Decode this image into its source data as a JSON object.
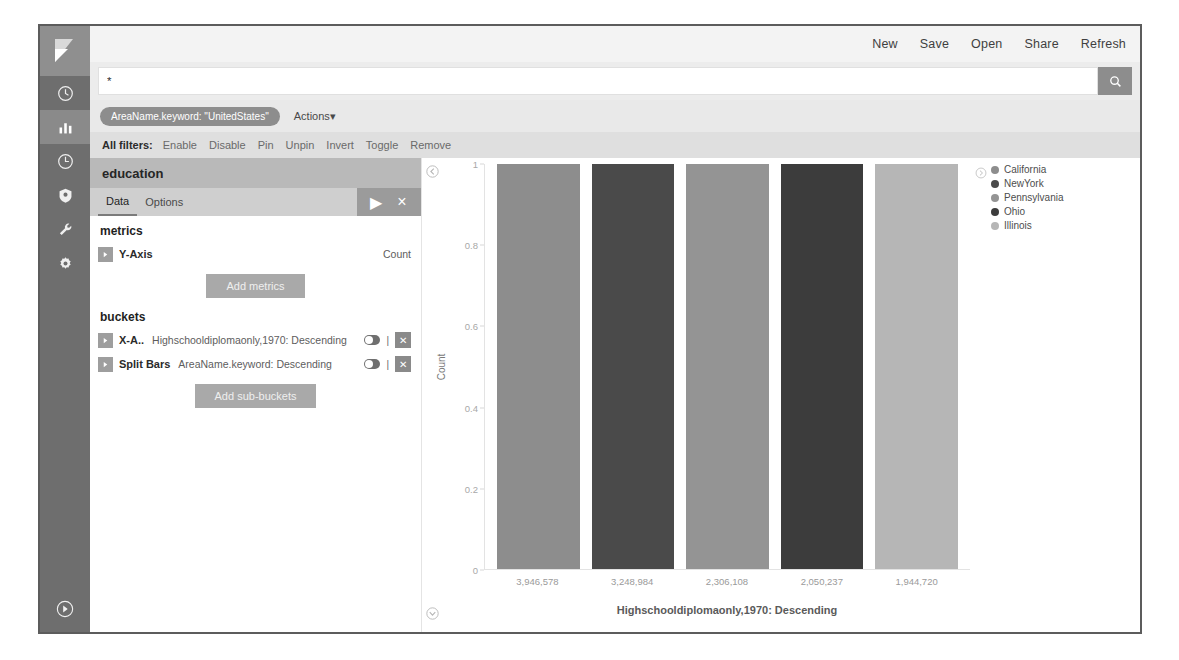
{
  "topnav": {
    "items": [
      {
        "label": "New",
        "name": "topnav-new"
      },
      {
        "label": "Save",
        "name": "topnav-save"
      },
      {
        "label": "Open",
        "name": "topnav-open"
      },
      {
        "label": "Share",
        "name": "topnav-share"
      },
      {
        "label": "Refresh",
        "name": "topnav-refresh"
      }
    ]
  },
  "search": {
    "value": "*",
    "placeholder": "Search...",
    "button_icon": "search-icon"
  },
  "filters": {
    "pill": "AreaName.keyword: \"UnitedStates\"",
    "actions_label": "Actions",
    "actions_caret": "▾",
    "all_filters_label": "All filters:",
    "links": [
      "Enable",
      "Disable",
      "Pin",
      "Unpin",
      "Invert",
      "Toggle",
      "Remove"
    ]
  },
  "editor": {
    "title": "education",
    "tabs": [
      {
        "label": "Data",
        "selected": true
      },
      {
        "label": "Options",
        "selected": false
      }
    ],
    "tab_actions": [
      {
        "icon": "play-icon",
        "glyph": "▶"
      },
      {
        "icon": "close-icon",
        "glyph": "×"
      }
    ],
    "metrics": {
      "heading": "metrics",
      "rows": [
        {
          "label": "Y-Axis",
          "value": "Count"
        }
      ],
      "add_button": "Add metrics"
    },
    "buckets": {
      "heading": "buckets",
      "rows": [
        {
          "label": "X-A..",
          "value": "Highschooldiplomaonly,1970: Descending",
          "bar_glyph": "|",
          "remove_glyph": "✕"
        },
        {
          "label": "Split Bars",
          "value": "AreaName.keyword: Descending",
          "bar_glyph": "|",
          "remove_glyph": "✕"
        }
      ],
      "add_button": "Add sub-buckets"
    }
  },
  "sidebar_rail": {
    "logo_name": "kibana-logo",
    "items": [
      {
        "name": "discover-icon",
        "active": false
      },
      {
        "name": "visualize-icon",
        "active": true
      },
      {
        "name": "dashboard-icon",
        "active": false
      },
      {
        "name": "timelion-icon",
        "active": false
      },
      {
        "name": "dev-tools-wrench-icon",
        "active": false
      },
      {
        "name": "management-gear-icon",
        "active": false
      }
    ],
    "collapse_icon": "collapse-arrow-icon"
  },
  "chart_data": {
    "type": "bar",
    "title": "",
    "xlabel": "Highschooldiplomaonly,1970: Descending",
    "ylabel": "Count",
    "ylim": [
      0,
      1
    ],
    "yticks": [
      "0",
      "0.2",
      "0.4",
      "0.6",
      "0.8",
      "1"
    ],
    "categories": [
      "3,946,578",
      "3,248,984",
      "2,306,108",
      "2,050,237",
      "1,944,720"
    ],
    "values": [
      1,
      1,
      1,
      1,
      1
    ],
    "bar_colors": [
      "#8d8d8d",
      "#4a4a4a",
      "#949494",
      "#3c3c3c",
      "#b6b6b6"
    ],
    "grid": false,
    "legend_position": "right",
    "legend": [
      {
        "label": "California",
        "color": "#8d8d8d"
      },
      {
        "label": "NewYork",
        "color": "#4a4a4a"
      },
      {
        "label": "Pennsylvania",
        "color": "#949494"
      },
      {
        "label": "Ohio",
        "color": "#3c3c3c"
      },
      {
        "label": "Illinois",
        "color": "#b6b6b6"
      }
    ]
  }
}
